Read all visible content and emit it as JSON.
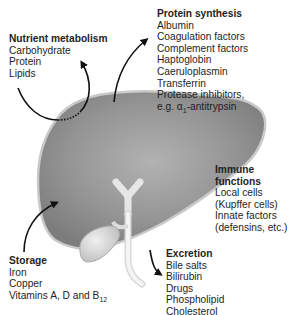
{
  "nutrient_metabolism": {
    "title": "Nutrient metabolism",
    "items": [
      "Carbohydrate",
      "Protein",
      "Lipids"
    ]
  },
  "protein_synthesis": {
    "title": "Protein synthesis",
    "items": [
      "Albumin",
      "Coagulation factors",
      "Complement factors",
      "Haptoglobin",
      "Caeruloplasmin",
      "Transferrin",
      "Protease inhibitors,"
    ],
    "last_item_prefix": "e.g. ",
    "last_item_alpha": "α",
    "last_item_sub": "1",
    "last_item_suffix": "-antitrypsin"
  },
  "immune_functions": {
    "title_line1": "Immune",
    "title_line2": "functions",
    "items": [
      "Local cells",
      "(Kupffer cells)",
      "Innate factors",
      "(defensins, etc.)"
    ]
  },
  "storage": {
    "title": "Storage",
    "items": [
      "Iron",
      "Copper"
    ],
    "last_item_prefix": "Vitamins A, D and B",
    "last_item_sub": "12"
  },
  "excretion": {
    "title": "Excretion",
    "items": [
      "Bile salts",
      "Bilirubin",
      "Drugs",
      "Phospholipid",
      "Cholesterol"
    ]
  },
  "colors": {
    "liver_fill": "#8c8c8c",
    "liver_edge": "#bdbdbd",
    "gallbladder": "#d4d4d4",
    "arrow": "#111111"
  }
}
